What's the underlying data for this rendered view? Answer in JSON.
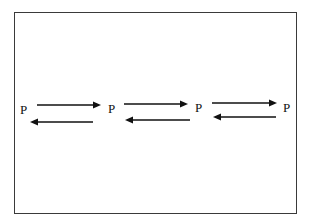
{
  "diagram": {
    "type": "reversible-chain",
    "nodes": [
      {
        "label": "P",
        "x": 20,
        "y": 103
      },
      {
        "label": "P",
        "x": 108,
        "y": 102
      },
      {
        "label": "P",
        "x": 195,
        "y": 101
      },
      {
        "label": "P",
        "x": 283,
        "y": 101
      }
    ],
    "arrows": [
      {
        "direction": "forward",
        "x1": 37,
        "x2": 101,
        "y": 105
      },
      {
        "direction": "backward",
        "x1": 93,
        "x2": 30,
        "y": 122
      },
      {
        "direction": "forward",
        "x1": 124,
        "x2": 188,
        "y": 104
      },
      {
        "direction": "backward",
        "x1": 190,
        "x2": 125,
        "y": 120
      },
      {
        "direction": "forward",
        "x1": 212,
        "x2": 277,
        "y": 103
      },
      {
        "direction": "backward",
        "x1": 276,
        "x2": 213,
        "y": 117
      }
    ],
    "colors": {
      "stroke": "#111111",
      "border": "#3a3a3a"
    }
  }
}
